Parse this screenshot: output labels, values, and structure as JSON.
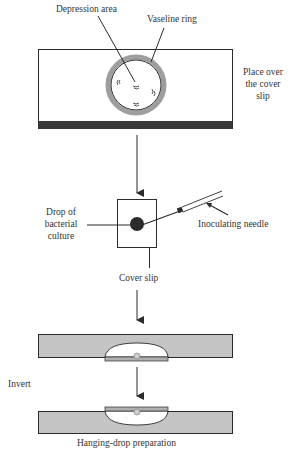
{
  "diagram": {
    "labels": {
      "depression_area": "Depression area",
      "vaseline_ring": "Vaseline ring",
      "place_over_line1": "Place over",
      "place_over_line2": "the cover",
      "place_over_line3": "slip",
      "drop_line1": "Drop of",
      "drop_line2": "bacterial",
      "drop_line3": "culture",
      "inoculating_needle": "Inoculating needle",
      "cover_slip": "Cover slip",
      "invert": "Invert",
      "hanging_drop": "Hanging-drop preparation"
    },
    "steps": [
      "Depression slide with Vaseline ring around depression area",
      "Drop of bacterial culture placed on cover slip with inoculating needle",
      "Slide placed over the cover slip",
      "Invert to obtain hanging-drop preparation"
    ],
    "colors": {
      "line": "#2b2b2b",
      "slide_gray": "#c4c4c4",
      "ring_gray": "#9e9e9e",
      "dark_bar": "#3a3a3a",
      "text": "#333333"
    }
  }
}
